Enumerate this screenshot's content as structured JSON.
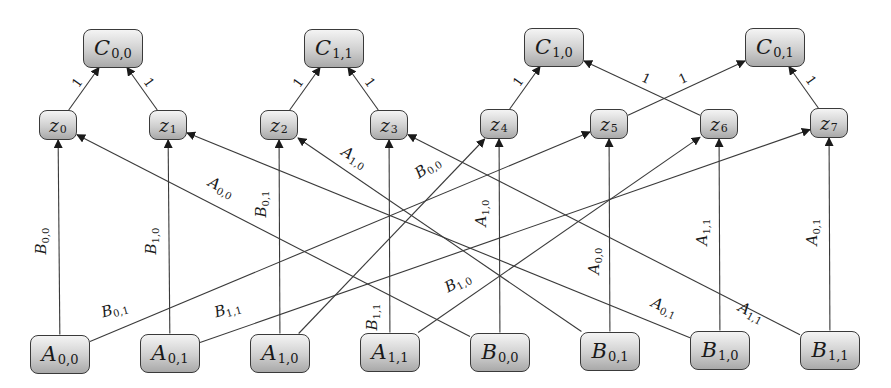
{
  "diagram": {
    "top_nodes": [
      {
        "id": "C00",
        "base": "C",
        "sub": "0,0",
        "x": 113,
        "y": 48
      },
      {
        "id": "C11",
        "base": "C",
        "sub": "1,1",
        "x": 334,
        "y": 48
      },
      {
        "id": "C10",
        "base": "C",
        "sub": "1,0",
        "x": 554,
        "y": 47
      },
      {
        "id": "C01",
        "base": "C",
        "sub": "0,1",
        "x": 775,
        "y": 47
      }
    ],
    "mid_nodes": [
      {
        "id": "z0",
        "base": "z",
        "sub": "0",
        "x": 58,
        "y": 125
      },
      {
        "id": "z1",
        "base": "z",
        "sub": "1",
        "x": 168,
        "y": 125
      },
      {
        "id": "z2",
        "base": "z",
        "sub": "2",
        "x": 279,
        "y": 125
      },
      {
        "id": "z3",
        "base": "z",
        "sub": "3",
        "x": 389,
        "y": 125
      },
      {
        "id": "z4",
        "base": "z",
        "sub": "4",
        "x": 499,
        "y": 124
      },
      {
        "id": "z5",
        "base": "z",
        "sub": "5",
        "x": 609,
        "y": 124
      },
      {
        "id": "z6",
        "base": "z",
        "sub": "6",
        "x": 719,
        "y": 124
      },
      {
        "id": "z7",
        "base": "z",
        "sub": "7",
        "x": 829,
        "y": 123
      }
    ],
    "bottom_nodes": [
      {
        "id": "A00",
        "base": "A",
        "sub": "0,0",
        "x": 60,
        "y": 354
      },
      {
        "id": "A01",
        "base": "A",
        "sub": "0,1",
        "x": 170,
        "y": 353
      },
      {
        "id": "A10",
        "base": "A",
        "sub": "1,0",
        "x": 280,
        "y": 353
      },
      {
        "id": "A11",
        "base": "A",
        "sub": "1,1",
        "x": 390,
        "y": 352
      },
      {
        "id": "B00",
        "base": "B",
        "sub": "0,0",
        "x": 500,
        "y": 352
      },
      {
        "id": "B01",
        "base": "B",
        "sub": "0,1",
        "x": 610,
        "y": 351
      },
      {
        "id": "B10",
        "base": "B",
        "sub": "1,0",
        "x": 720,
        "y": 350
      },
      {
        "id": "B11",
        "base": "B",
        "sub": "1,1",
        "x": 830,
        "y": 350
      }
    ],
    "top_edges": [
      {
        "from": "z0",
        "to": "C00",
        "label": "1"
      },
      {
        "from": "z1",
        "to": "C00",
        "label": "1"
      },
      {
        "from": "z2",
        "to": "C11",
        "label": "1"
      },
      {
        "from": "z3",
        "to": "C11",
        "label": "1"
      },
      {
        "from": "z4",
        "to": "C10",
        "label": "1"
      },
      {
        "from": "z6",
        "to": "C10",
        "label": "1"
      },
      {
        "from": "z5",
        "to": "C01",
        "label": "1"
      },
      {
        "from": "z7",
        "to": "C01",
        "label": "1"
      }
    ],
    "bottom_edges": [
      {
        "from": "A00",
        "to": "z0",
        "label_base": "B",
        "label_sub": "0,0",
        "lx": 42,
        "ly": 242,
        "rot": -90
      },
      {
        "from": "B00",
        "to": "z0",
        "label_base": "A",
        "label_sub": "0,0",
        "lx": 222,
        "ly": 188,
        "rot": 28
      },
      {
        "from": "A01",
        "to": "z1",
        "label_base": "B",
        "label_sub": "1,0",
        "lx": 152,
        "ly": 242,
        "rot": -90
      },
      {
        "from": "B10",
        "to": "z1",
        "label_base": "B",
        "label_sub": "0,1",
        "lx": 262,
        "ly": 205,
        "rot": -90
      },
      {
        "from": "A10",
        "to": "z2",
        "label_base": "B",
        "label_sub": "0,1",
        "lx": 262,
        "ly": 205,
        "rot": -90
      },
      {
        "from": "B01",
        "to": "z2",
        "label_base": "A",
        "label_sub": "1,0",
        "lx": 355,
        "ly": 158,
        "rot": 32
      },
      {
        "from": "A11",
        "to": "z3",
        "label_base": "B",
        "label_sub": "1,1",
        "lx": 373,
        "ly": 318,
        "rot": -90
      },
      {
        "from": "B11",
        "to": "z3",
        "label_base": "A",
        "label_sub": "1,1",
        "lx": 752,
        "ly": 313,
        "rot": 28
      },
      {
        "from": "B00",
        "to": "z4",
        "label_base": "A",
        "label_sub": "1,0",
        "lx": 482,
        "ly": 214,
        "rot": -90
      },
      {
        "from": "A10",
        "to": "z4",
        "label_base": "B",
        "label_sub": "0,0",
        "lx": 428,
        "ly": 168,
        "rot": -34
      },
      {
        "from": "B01",
        "to": "z5",
        "label_base": "A",
        "label_sub": "0,0",
        "lx": 595,
        "ly": 262,
        "rot": -90
      },
      {
        "from": "A00",
        "to": "z5",
        "label_base": "B",
        "label_sub": "0,1",
        "lx": 115,
        "ly": 310,
        "rot": -16
      },
      {
        "from": "B10",
        "to": "z6",
        "label_base": "A",
        "label_sub": "1,1",
        "lx": 703,
        "ly": 233,
        "rot": -90
      },
      {
        "from": "A11",
        "to": "z6",
        "label_base": "B",
        "label_sub": "1,0",
        "lx": 458,
        "ly": 283,
        "rot": -28
      },
      {
        "from": "B11",
        "to": "z7",
        "label_base": "A",
        "label_sub": "0,1",
        "lx": 813,
        "ly": 233,
        "rot": -90
      },
      {
        "from": "A01",
        "to": "z7",
        "label_base": "B",
        "label_sub": "1,1",
        "lx": 228,
        "ly": 310,
        "rot": -16
      }
    ],
    "extra_labels": [
      {
        "base": "A",
        "sub": "0,1",
        "lx": 665,
        "ly": 308,
        "rot": 25
      }
    ],
    "colors": {
      "line": "#3a3a3a",
      "node_border": "#3a3a3a",
      "text": "#1a1a1a"
    }
  }
}
